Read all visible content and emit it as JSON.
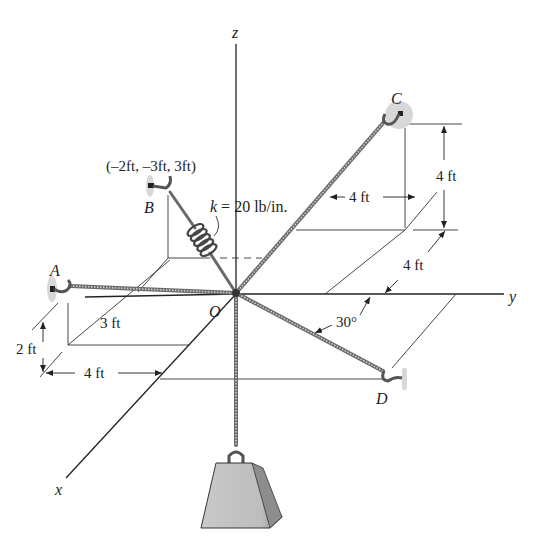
{
  "figure": {
    "axes": {
      "x_label": "x",
      "y_label": "y",
      "z_label": "z",
      "origin_label": "O"
    },
    "points": {
      "A": {
        "label": "A"
      },
      "B": {
        "label": "B",
        "coordinates": "(–2ft, –3ft, 3ft)"
      },
      "C": {
        "label": "C"
      },
      "D": {
        "label": "D"
      }
    },
    "spring": {
      "label": "k = 20 lb/in.",
      "k_symbol": "k",
      "k_value": "= 20 lb/in."
    },
    "dimensions": {
      "a_3ft": "3 ft",
      "a_2ft": "2 ft",
      "a_4ft": "4 ft",
      "c_4ft_horizontal": "4 ft",
      "c_4ft_vertical": "4 ft",
      "c_4ft_depth": "4 ft",
      "d_angle": "30°"
    },
    "colors": {
      "line": "#222222",
      "cable": "#6a6a6a",
      "weight_fill": "#b8b8b8",
      "anchor_fill": "#d8d8d8"
    }
  }
}
